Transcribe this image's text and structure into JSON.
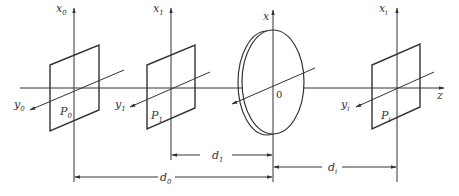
{
  "diagram": {
    "colors": {
      "line": "#333333",
      "background": "#ffffff"
    },
    "axis": {
      "z_label": "z",
      "origin_label": "0",
      "lens_x_label": "x"
    },
    "planes": [
      {
        "id": "P0",
        "name": "P",
        "sub": "0",
        "x_axis": "x",
        "x_sub": "0",
        "y_axis": "y",
        "y_sub": "0"
      },
      {
        "id": "P1",
        "name": "P",
        "sub": "1",
        "x_axis": "x",
        "x_sub": "1",
        "y_axis": "y",
        "y_sub": "1"
      },
      {
        "id": "Pi",
        "name": "P",
        "sub": "i",
        "x_axis": "x",
        "x_sub": "i",
        "y_axis": "y",
        "y_sub": "i"
      }
    ],
    "lens": {
      "label": "lens"
    },
    "distances": [
      {
        "id": "d1",
        "name": "d",
        "sub": "1"
      },
      {
        "id": "d0",
        "name": "d",
        "sub": "0"
      },
      {
        "id": "di",
        "name": "d",
        "sub": "i"
      }
    ]
  }
}
